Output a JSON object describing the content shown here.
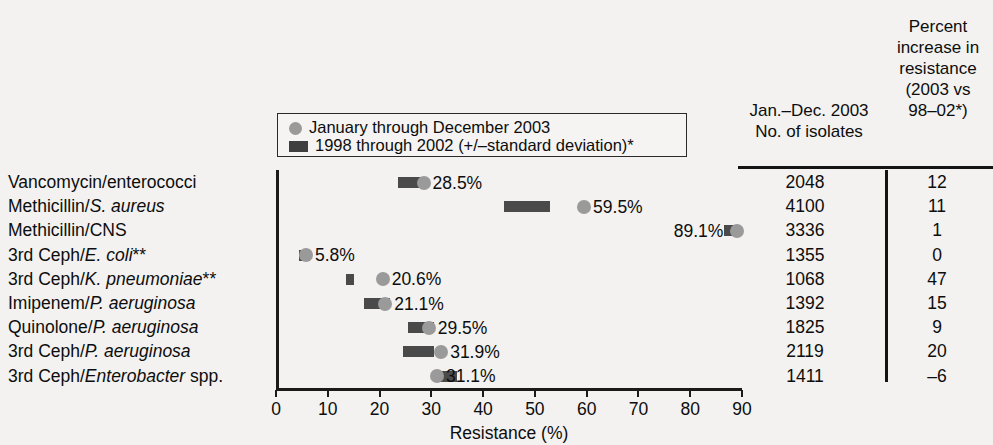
{
  "chart_data": {
    "type": "scatter",
    "title": "",
    "xlabel": "Resistance (%)",
    "ylabel": "",
    "xlim": [
      0,
      90
    ],
    "xticks": [
      0,
      10,
      20,
      30,
      40,
      50,
      60,
      70,
      80,
      90
    ],
    "grid": false,
    "legend_position": "top-center",
    "legend": [
      "January through December 2003",
      "1998 through 2002 (+/–standard deviation)*"
    ],
    "categories": [
      "Vancomycin/enterococci",
      "Methicillin/S. aureus",
      "Methicillin/CNS",
      "3rd Ceph/E. coli**",
      "3rd Ceph/K. pneumoniae**",
      "Imipenem/P. aeruginosa",
      "Quinolone/P. aeruginosa",
      "3rd Ceph/P. aeruginosa",
      "3rd Ceph/Enterobacter spp."
    ],
    "series": [
      {
        "name": "January through December 2003",
        "values": [
          28.5,
          59.5,
          89.1,
          5.8,
          20.6,
          21.1,
          29.5,
          31.9,
          31.1
        ]
      },
      {
        "name": "1998 through 2002 (+/–standard deviation)*",
        "range_low": [
          23.5,
          44.0,
          86.5,
          4.5,
          13.5,
          17.0,
          25.5,
          24.5,
          31.5
        ],
        "range_high": [
          28.0,
          53.0,
          89.5,
          6.5,
          15.0,
          22.0,
          30.5,
          30.5,
          35.0
        ]
      }
    ],
    "value_labels": [
      "28.5%",
      "59.5%",
      "89.1%",
      "5.8%",
      "20.6%",
      "21.1%",
      "29.5%",
      "31.9%",
      "31.1%"
    ],
    "isolates": [
      2048,
      4100,
      3336,
      1355,
      1068,
      1392,
      1825,
      2119,
      1411
    ],
    "percent_increase": [
      "12",
      "11",
      "1",
      "0",
      "47",
      "15",
      "9",
      "20",
      "–6"
    ]
  },
  "axis": {
    "x_title": "Resistance (%)",
    "tick_labels": [
      "0",
      "10",
      "20",
      "30",
      "40",
      "50",
      "60",
      "70",
      "80",
      "90"
    ]
  },
  "legend": {
    "item1": "January through December 2003",
    "item2": "1998 through 2002 (+/–standard deviation)*"
  },
  "table": {
    "header_isolates_line1": "Jan.–Dec. 2003",
    "header_isolates_line2": "No. of isolates",
    "header_increase_line1": "Percent",
    "header_increase_line2": "increase in",
    "header_increase_line3": "resistance",
    "header_increase_line4": "(2003 vs",
    "header_increase_line5": "98–02*)"
  },
  "categories_html": [
    "Vancomycin/enterococci",
    "Methicillin/<i>S. aureus</i>",
    "Methicillin/CNS",
    "3rd Ceph/<i>E. coli</i>**",
    "3rd Ceph/<i>K. pneumoniae</i>**",
    "Imipenem/<i>P. aeruginosa</i>",
    "Quinolone/<i>P. aeruginosa</i>",
    "3rd Ceph/<i>P. aeruginosa</i>",
    "3rd Ceph/<i>Enterobacter</i> spp."
  ],
  "colors": {
    "bar": "#4a4a4a",
    "dot": "#9a9a9a",
    "axis": "#1a1a1a",
    "background": "#f3f2f0"
  }
}
